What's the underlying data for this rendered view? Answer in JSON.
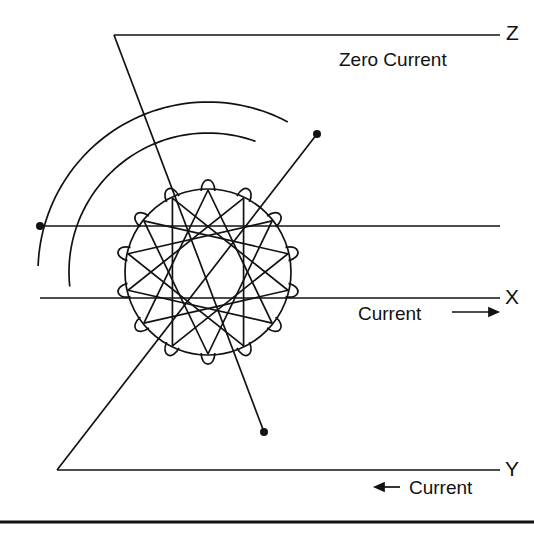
{
  "figure": {
    "background_color": "#ffffff",
    "stroke_color": "#121212",
    "width": 534,
    "height": 539
  },
  "axes": [
    {
      "id": "z",
      "letter": "Z",
      "y": 35,
      "x_start": 114,
      "x_end": 500,
      "annotation": "Zero Current",
      "arrow": "none"
    },
    {
      "id": "x",
      "letter": "X",
      "y": 298,
      "x_start": 40,
      "x_end": 500,
      "annotation": "Current",
      "arrow": "right"
    },
    {
      "id": "y",
      "letter": "Y",
      "y": 470,
      "x_start": 57,
      "x_end": 500,
      "annotation": "Current",
      "arrow": "left"
    }
  ],
  "labels": {
    "z_letter": "Z",
    "x_letter": "X",
    "y_letter": "Y",
    "zero_current": "Zero Current",
    "current_x": "Current",
    "current_y": "Current"
  },
  "coil": {
    "type": "toroidal-winding",
    "center_x": 208,
    "center_y": 272,
    "radius": 83,
    "loop_count": 14,
    "loop_radius": 11,
    "chord_step": 5,
    "chord_count": 14
  },
  "arcs": [
    {
      "id": "outer-arc",
      "center_x": 208,
      "center_y": 272,
      "radius": 170,
      "start_deg": 178,
      "end_deg": 62
    },
    {
      "id": "inner-arc",
      "center_x": 208,
      "center_y": 272,
      "radius": 139,
      "start_deg": 186,
      "end_deg": 70
    }
  ],
  "terminals": [
    {
      "id": "terminal-left",
      "x": 40,
      "y": 226,
      "radius": 4
    },
    {
      "id": "terminal-upper-right",
      "x": 317,
      "y": 134,
      "radius": 4
    },
    {
      "id": "terminal-lower-right",
      "x": 264,
      "y": 432,
      "radius": 4
    }
  ],
  "leads": [
    {
      "id": "lead-z",
      "points": "114,35 264,432"
    },
    {
      "id": "lead-y",
      "points": "57,470 317,134"
    },
    {
      "id": "lead-x",
      "points": "40,226 500,226"
    }
  ],
  "rule": {
    "id": "bottom-rule",
    "y": 522,
    "x_start": 0,
    "x_end": 534,
    "thickness": 3
  },
  "colors": {
    "stroke": "#121212",
    "text": "#121212",
    "background": "#ffffff"
  }
}
